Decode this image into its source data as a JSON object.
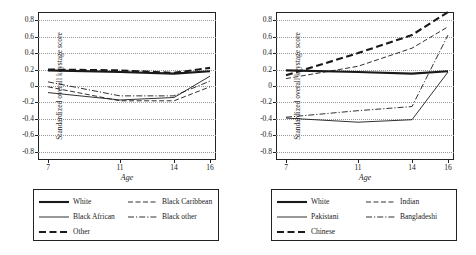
{
  "chart_data": [
    {
      "type": "line",
      "panel": "left",
      "title": "",
      "xlabel": "Age",
      "ylabel": "Standardized overall keystage score",
      "x": [
        7,
        11,
        14,
        16
      ],
      "xticks": [
        "7",
        "11",
        "14",
        "16"
      ],
      "ylim": [
        -0.9,
        0.9
      ],
      "yticks": [
        "0.8",
        "0.6",
        "0.4",
        "0.2",
        "0",
        "-0.2",
        "-0.4",
        "-0.6",
        "-0.8"
      ],
      "grid": true,
      "legend_position": "below",
      "series": [
        {
          "name": "White",
          "style": "solid-thick",
          "values": [
            0.19,
            0.17,
            0.15,
            0.18
          ]
        },
        {
          "name": "Black African",
          "style": "solid-thin",
          "values": [
            -0.08,
            -0.17,
            -0.14,
            0.12
          ]
        },
        {
          "name": "Other",
          "style": "dashed-thick",
          "values": [
            0.2,
            0.19,
            0.16,
            0.22
          ]
        },
        {
          "name": "Black Caribbean",
          "style": "dashed-thin",
          "values": [
            -0.01,
            -0.18,
            -0.18,
            -0.01
          ]
        },
        {
          "name": "Black other",
          "style": "dash-dot",
          "values": [
            0.05,
            -0.12,
            -0.12,
            0.06
          ]
        }
      ]
    },
    {
      "type": "line",
      "panel": "right",
      "title": "",
      "xlabel": "Age",
      "ylabel": "Standardized overall keystage score",
      "x": [
        7,
        11,
        14,
        16
      ],
      "xticks": [
        "7",
        "11",
        "14",
        "16"
      ],
      "ylim": [
        -0.9,
        0.9
      ],
      "yticks": [
        "0.8",
        "0.6",
        "0.4",
        "0.2",
        "0",
        "-0.2",
        "-0.4",
        "-0.6",
        "-0.8"
      ],
      "grid": true,
      "legend_position": "below",
      "series": [
        {
          "name": "White",
          "style": "solid-thick",
          "values": [
            0.19,
            0.17,
            0.15,
            0.18
          ]
        },
        {
          "name": "Pakistani",
          "style": "solid-thin",
          "values": [
            -0.39,
            -0.44,
            -0.41,
            0.17
          ]
        },
        {
          "name": "Chinese",
          "style": "dashed-thick",
          "values": [
            0.13,
            0.4,
            0.62,
            0.9
          ]
        },
        {
          "name": "Indian",
          "style": "dashed-thin",
          "values": [
            0.09,
            0.24,
            0.46,
            0.72
          ]
        },
        {
          "name": "Bangladeshi",
          "style": "dash-dot",
          "values": [
            -0.38,
            -0.3,
            -0.25,
            0.62
          ]
        }
      ]
    }
  ],
  "panels": {
    "left": {
      "axis_x_title": "Age",
      "axis_y_title": "Standardized overall keystage score",
      "yticks": [
        "0.8",
        "0.6",
        "0.4",
        "0.2",
        "0",
        "-0.2",
        "-0.4",
        "-0.6",
        "-0.8"
      ],
      "xticks": [
        "7",
        "11",
        "14",
        "16"
      ],
      "legend": [
        {
          "label": "White"
        },
        {
          "label": "Black Caribbean"
        },
        {
          "label": "Black African"
        },
        {
          "label": "Black other"
        },
        {
          "label": "Other"
        }
      ]
    },
    "right": {
      "axis_x_title": "Age",
      "axis_y_title": "Standardized overall keystage score",
      "yticks": [
        "0.8",
        "0.6",
        "0.4",
        "0.2",
        "0",
        "-0.2",
        "-0.4",
        "-0.6",
        "-0.8"
      ],
      "xticks": [
        "7",
        "11",
        "14",
        "16"
      ],
      "legend": [
        {
          "label": "White"
        },
        {
          "label": "Indian"
        },
        {
          "label": "Pakistani"
        },
        {
          "label": "Bangladeshi"
        },
        {
          "label": "Chinese"
        }
      ]
    }
  },
  "colors": {
    "line": "#1a1a1a",
    "grid": "#999999",
    "axis": "#222222",
    "background": "#ffffff"
  }
}
